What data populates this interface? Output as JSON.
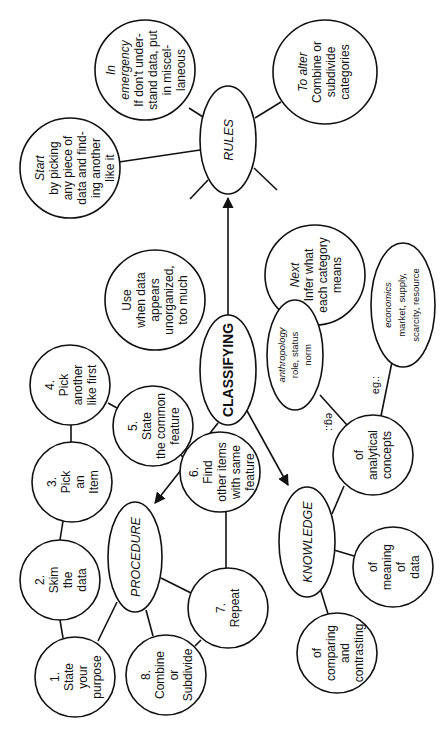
{
  "diagram": {
    "title": "CLASSIFYING",
    "orientation": "rotated 90 degrees counter-clockwise",
    "central": {
      "label": "CLASSIFYING"
    },
    "hubs": {
      "rules": "RULES",
      "procedure": "PROCEDURE",
      "knowledge": "KNOWLEDGE"
    },
    "rules": {
      "start": {
        "heading": "Start",
        "lines": [
          "by picking",
          "any piece of",
          "data and find-",
          "ing another",
          "like it"
        ]
      },
      "emergency": {
        "heading1": "In",
        "heading2": "emergency",
        "lines": [
          "If don't under-",
          "stand data, put",
          "in miscel-",
          "laneous"
        ]
      },
      "alter": {
        "heading": "To alter",
        "lines": [
          "Combine or",
          "subdivide",
          "categories"
        ]
      },
      "use": {
        "line1": "Use",
        "lines": [
          "when data",
          "appears",
          "unorganized,",
          "too much"
        ]
      },
      "next": {
        "heading": "Next",
        "lines": [
          "Infer what",
          "each category",
          "means"
        ]
      }
    },
    "procedure": {
      "step1": {
        "num": "1.",
        "lines": [
          "State",
          "your",
          "purpose"
        ]
      },
      "step2": {
        "num": "2.",
        "lines": [
          "Skim",
          "the",
          "data"
        ]
      },
      "step3": {
        "num": "3.",
        "lines": [
          "Pick",
          "an",
          "Item"
        ]
      },
      "step4": {
        "num": "4.",
        "lines": [
          "Pick",
          "another",
          "like first"
        ]
      },
      "step5": {
        "num": "5.",
        "lines": [
          "State",
          "the common",
          "feature"
        ]
      },
      "step6": {
        "num": "6.",
        "lines": [
          "Find",
          "other items",
          "with same",
          "feature"
        ]
      },
      "step7": {
        "num": "7.",
        "lines": [
          "Repeat"
        ]
      },
      "step8": {
        "num": "8.",
        "lines": [
          "Combine",
          "or",
          "Subdivide"
        ]
      }
    },
    "knowledge": {
      "analytical": {
        "lines": [
          "of",
          "analytical",
          "concepts"
        ]
      },
      "meaning": {
        "lines": [
          "of",
          "meaning",
          "of",
          "data"
        ]
      },
      "comparing": {
        "lines": [
          "of",
          "comparing",
          "and",
          "contrasting"
        ]
      },
      "anthropology": {
        "heading": "anthropology",
        "lines": [
          "role, status",
          "norm"
        ]
      },
      "economics": {
        "heading": "economics",
        "lines": [
          "market, supply,",
          "scarcity, resource"
        ]
      },
      "eg_label_1": "eg.:",
      "eg_label_2": "eg.:"
    },
    "colors": {
      "stroke": "#111111",
      "background": "#ffffff"
    }
  }
}
